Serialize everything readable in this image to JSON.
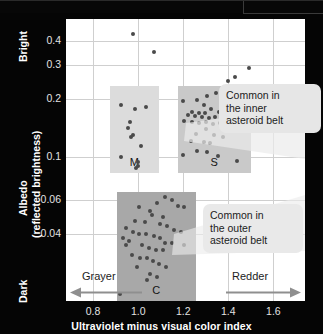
{
  "chart_data": {
    "type": "scatter",
    "title": "",
    "xlabel": "Ultraviolet minus visual color index",
    "ylabel_lines": [
      "Albedo",
      "(reflected brightness)"
    ],
    "y_axis_scale": "log",
    "xlim": [
      0.68,
      1.74
    ],
    "ylim": [
      0.018,
      0.52
    ],
    "xticks": [
      0.8,
      1.0,
      1.2,
      1.4,
      1.6
    ],
    "xtick_labels": [
      "0.8",
      "1.0",
      "1.2",
      "1.4",
      "1.6"
    ],
    "yticks": [
      0.4,
      0.3,
      0.2,
      0.1,
      0.06,
      0.04
    ],
    "ytick_labels": [
      "0.4",
      "0.3",
      "0.2",
      "0.1",
      "0.06",
      "0.04"
    ],
    "y_axis_end_labels": {
      "high": "Bright",
      "low": "Dark"
    },
    "x_axis_end_labels": {
      "low": "Grayer",
      "high": "Redder"
    },
    "grid": true,
    "legend": "none",
    "marker_color": "#4a4a4a",
    "groups": [
      {
        "name": "M",
        "label": "M",
        "band_color": "#dcdcdc",
        "band_x_range": [
          0.875,
          1.09
        ],
        "band_y_range": [
          0.083,
          0.235
        ],
        "points": [
          [
            0.925,
            0.187
          ],
          [
            0.985,
            0.178
          ],
          [
            1.035,
            0.182
          ],
          [
            0.965,
            0.152
          ],
          [
            0.955,
            0.142
          ],
          [
            0.975,
            0.131
          ],
          [
            0.968,
            0.127
          ],
          [
            1.012,
            0.115
          ],
          [
            0.925,
            0.1
          ],
          [
            1.0,
            0.094
          ],
          [
            0.998,
            0.09
          ],
          [
            0.99,
            0.088
          ]
        ]
      },
      {
        "name": "S",
        "label": "S",
        "band_color": "#c9c9c9",
        "band_x_range": [
          1.175,
          1.5
        ],
        "band_y_range": [
          0.083,
          0.235
        ],
        "points": [
          [
            1.345,
            0.215
          ],
          [
            1.305,
            0.208
          ],
          [
            1.38,
            0.205
          ],
          [
            1.26,
            0.198
          ],
          [
            1.2,
            0.196
          ],
          [
            1.415,
            0.192
          ],
          [
            1.445,
            0.188
          ],
          [
            1.29,
            0.186
          ],
          [
            1.325,
            0.178
          ],
          [
            1.24,
            0.172
          ],
          [
            1.268,
            0.17
          ],
          [
            1.298,
            0.17
          ],
          [
            1.358,
            0.172
          ],
          [
            1.392,
            0.168
          ],
          [
            1.432,
            0.168
          ],
          [
            1.222,
            0.165
          ],
          [
            1.252,
            0.163
          ],
          [
            1.282,
            0.162
          ],
          [
            1.312,
            0.16
          ],
          [
            1.34,
            0.162
          ],
          [
            1.368,
            0.158
          ],
          [
            1.398,
            0.16
          ],
          [
            1.455,
            0.162
          ],
          [
            1.205,
            0.155
          ],
          [
            1.238,
            0.152
          ],
          [
            1.27,
            0.15
          ],
          [
            1.3,
            0.152
          ],
          [
            1.33,
            0.148
          ],
          [
            1.362,
            0.15
          ],
          [
            1.3,
            0.14
          ],
          [
            1.42,
            0.145
          ],
          [
            1.258,
            0.132
          ],
          [
            1.335,
            0.13
          ],
          [
            1.378,
            0.128
          ],
          [
            1.232,
            0.122
          ],
          [
            1.292,
            0.12
          ],
          [
            1.32,
            0.118
          ],
          [
            1.262,
            0.108
          ],
          [
            1.305,
            0.106
          ],
          [
            1.2,
            0.103
          ],
          [
            1.352,
            0.102
          ],
          [
            1.438,
            0.096
          ],
          [
            1.398,
            0.248
          ],
          [
            1.428,
            0.262
          ]
        ]
      },
      {
        "name": "C",
        "label": "C",
        "band_color": "#a8a8a8",
        "band_x_range": [
          0.905,
          1.255
        ],
        "band_y_range": [
          0.018,
          0.066
        ],
        "points": [
          [
            1.118,
            0.062
          ],
          [
            1.148,
            0.06
          ],
          [
            1.085,
            0.058
          ],
          [
            1.005,
            0.055
          ],
          [
            1.175,
            0.056
          ],
          [
            1.205,
            0.055
          ],
          [
            1.052,
            0.053
          ],
          [
            1.062,
            0.05
          ],
          [
            1.108,
            0.049
          ],
          [
            0.985,
            0.047
          ],
          [
            1.028,
            0.046
          ],
          [
            1.095,
            0.045
          ],
          [
            1.128,
            0.044
          ],
          [
            1.158,
            0.042
          ],
          [
            1.188,
            0.041
          ],
          [
            0.948,
            0.043
          ],
          [
            0.975,
            0.041
          ],
          [
            1.005,
            0.04
          ],
          [
            1.035,
            0.04
          ],
          [
            1.068,
            0.039
          ],
          [
            1.098,
            0.038
          ],
          [
            0.932,
            0.038
          ],
          [
            0.96,
            0.037
          ],
          [
            1.118,
            0.036
          ],
          [
            1.148,
            0.036
          ],
          [
            1.205,
            0.035
          ],
          [
            0.945,
            0.035
          ],
          [
            1.018,
            0.035
          ],
          [
            1.048,
            0.034
          ],
          [
            1.078,
            0.033
          ],
          [
            1.108,
            0.033
          ],
          [
            0.972,
            0.031
          ],
          [
            1.008,
            0.03
          ],
          [
            1.038,
            0.03
          ],
          [
            1.065,
            0.029
          ],
          [
            1.092,
            0.028
          ],
          [
            0.995,
            0.027
          ],
          [
            1.125,
            0.027
          ],
          [
            1.052,
            0.025
          ],
          [
            1.082,
            0.024
          ],
          [
            1.038,
            0.023
          ],
          [
            0.918,
            0.0195
          ]
        ]
      },
      {
        "name": "bright-outliers",
        "label": "",
        "band_color": "",
        "band_x_range": [],
        "band_y_range": [],
        "points": [
          [
            0.975,
            0.437
          ],
          [
            1.068,
            0.352
          ],
          [
            1.49,
            0.29
          ]
        ]
      }
    ],
    "annotations": [
      {
        "id": "inner-belt",
        "lines": [
          "Common in",
          "the inner",
          "asteroid belt"
        ],
        "points_to": "S"
      },
      {
        "id": "outer-belt",
        "lines": [
          "Common in",
          "the outer",
          "asteroid belt"
        ],
        "points_to": "C"
      }
    ]
  },
  "axis": {
    "x_title": "Ultraviolet minus visual color index",
    "y_title_line1": "Albedo",
    "y_title_line2": "(reflected brightness)",
    "bright_label": "Bright",
    "dark_label": "Dark",
    "xticks": [
      "0.8",
      "1.0",
      "1.2",
      "1.4",
      "1.6"
    ],
    "yticks": [
      "0.4",
      "0.3",
      "0.2",
      "0.1",
      "0.06",
      "0.04"
    ]
  },
  "direction": {
    "grayer": "Grayer",
    "redder": "Redder"
  },
  "callouts": {
    "inner": {
      "l1": "Common in",
      "l2": "the inner",
      "l3": "asteroid belt"
    },
    "outer": {
      "l1": "Common in",
      "l2": "the outer",
      "l3": "asteroid belt"
    }
  },
  "group_labels": {
    "m": "M",
    "s": "S",
    "c": "C"
  },
  "colors": {
    "background": "#050505",
    "plot_background": "#ffffff",
    "grid": "#cfcfcf",
    "marker": "#4a4a4a",
    "band_m": "#dcdcdc",
    "band_s": "#c9c9c9",
    "band_c": "#a8a8a8",
    "callout_bg": "#e6e6e6",
    "axis_text": "#e2e2e2",
    "arrow": "#8f8f8f"
  }
}
